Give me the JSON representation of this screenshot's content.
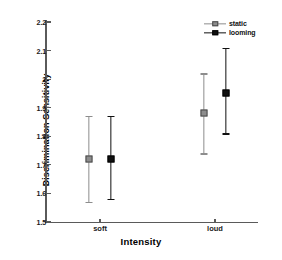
{
  "chart_data": {
    "type": "scatter",
    "title": "",
    "xlabel": "Intensity",
    "ylabel": "Discrimination Sensitivity",
    "categories": [
      "soft",
      "loud"
    ],
    "ylim": [
      1.5,
      2.2
    ],
    "yticks": [
      "1.5",
      "1.6",
      "1.7",
      "1.8",
      "1.9",
      "2",
      "2.1",
      "2.2"
    ],
    "ytick_values": [
      1.5,
      1.6,
      1.7,
      1.8,
      1.9,
      2.0,
      2.1,
      2.2
    ],
    "grid": false,
    "legend_position": "top-right",
    "error_bar_type": "95% CI",
    "series": [
      {
        "name": "static",
        "color": "#8d8d8d",
        "marker": "square-gray",
        "values": [
          1.72,
          1.88
        ],
        "err_low": [
          1.57,
          1.74
        ],
        "err_high": [
          1.87,
          2.02
        ]
      },
      {
        "name": "looming",
        "color": "#101010",
        "marker": "square-filled",
        "values": [
          1.72,
          1.95
        ],
        "err_low": [
          1.58,
          1.81
        ],
        "err_high": [
          1.87,
          2.11
        ]
      }
    ]
  },
  "legend": {
    "items": [
      {
        "label": "static"
      },
      {
        "label": "looming"
      }
    ]
  }
}
